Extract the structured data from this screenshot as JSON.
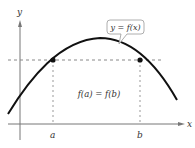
{
  "diagram": {
    "axes": {
      "x_label": "x",
      "y_label": "y"
    },
    "points": {
      "a_label": "a",
      "b_label": "b"
    },
    "callout": {
      "text": "y = f(x)"
    },
    "equation": "f(a) = f(b)",
    "colors": {
      "curve": "#111111",
      "axis": "#777777",
      "dashed": "#888888",
      "callout_border": "#999999",
      "text": "#333333"
    }
  }
}
